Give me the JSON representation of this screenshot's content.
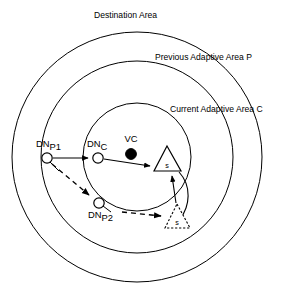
{
  "figure": {
    "background_color": "#ffffff",
    "stroke_color": "#000000"
  },
  "areas": [
    {
      "id": "destination",
      "label": "Destination Area",
      "label_x": 94,
      "label_y": 18,
      "cx": 137,
      "cy": 157,
      "r": 125
    },
    {
      "id": "previous",
      "label": "Previous Adaptive Area P",
      "label_x": 155,
      "label_y": 60,
      "cx": 137,
      "cy": 157,
      "r": 96
    },
    {
      "id": "current",
      "label": "Current Adaptive Area C",
      "label_x": 170,
      "label_y": 112,
      "cx": 137,
      "cy": 157,
      "r": 54
    }
  ],
  "nodes": [
    {
      "id": "dn-p1",
      "label_main": "DN",
      "label_sub": "P1",
      "label_x": 36,
      "label_y": 147,
      "cx": 47,
      "cy": 158,
      "r": 5.2
    },
    {
      "id": "dn-c",
      "label_main": "DN",
      "label_sub": "C",
      "label_x": 87,
      "label_y": 147,
      "cx": 98,
      "cy": 158,
      "r": 5.2
    },
    {
      "id": "dn-p2",
      "label_main": "DN",
      "label_sub": "P2",
      "label_x": 88,
      "label_y": 218,
      "cx": 99,
      "cy": 203,
      "r": 5.2
    }
  ],
  "vc": {
    "id": "vc",
    "label": "VC",
    "label_x": 131,
    "label_y": 142,
    "cx": 131,
    "cy": 154,
    "r": 5.4
  },
  "sinks": [
    {
      "id": "sink-current",
      "label": "s",
      "style": "solid",
      "apex_x": 167,
      "apex_y": 146,
      "left_x": 154,
      "right_x": 181,
      "base_y": 171,
      "label_x": 167,
      "label_y": 168
    },
    {
      "id": "sink-previous",
      "label": "s",
      "style": "dashed",
      "apex_x": 177,
      "apex_y": 204,
      "left_x": 165,
      "right_x": 190,
      "base_y": 228,
      "label_x": 177,
      "label_y": 225
    }
  ],
  "flows": [
    {
      "id": "flow-p1-to-c",
      "style": "solid",
      "from": "dn-p1",
      "to": "dn-c"
    },
    {
      "id": "flow-c-to-sink",
      "style": "solid",
      "from": "dn-c",
      "to": "sink-current"
    },
    {
      "id": "flow-p1-to-p2",
      "style": "dashed",
      "from": "dn-p1",
      "to": "dn-p2"
    },
    {
      "id": "flow-p2-to-sink",
      "style": "dashed",
      "from": "dn-p2",
      "to": "sink-previous"
    },
    {
      "id": "flow-sink-to-sink",
      "style": "solid",
      "from": "sink-previous",
      "to": "sink-current"
    }
  ]
}
